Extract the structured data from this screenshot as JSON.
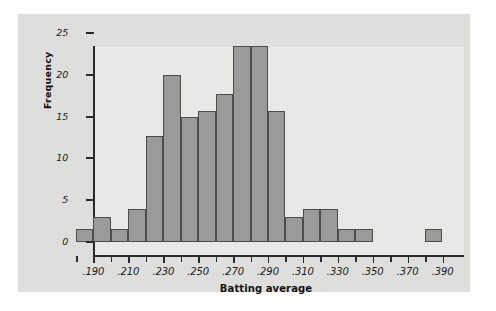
{
  "chart_data": {
    "type": "bar",
    "subtype": "histogram",
    "title": "",
    "xlabel": "Batting average",
    "ylabel": "Frequency",
    "bin_width": 0.01,
    "bin_starts": [
      0.18,
      0.19,
      0.2,
      0.21,
      0.22,
      0.23,
      0.24,
      0.25,
      0.26,
      0.27,
      0.28,
      0.29,
      0.3,
      0.31,
      0.32,
      0.33,
      0.34,
      0.35,
      0.36,
      0.37,
      0.38
    ],
    "categories": [
      ".180-.190",
      ".190-.200",
      ".200-.210",
      ".210-.220",
      ".220-.230",
      ".230-.240",
      ".240-.250",
      ".250-.260",
      ".260-.270",
      ".270-.280",
      ".280-.290",
      ".290-.300",
      ".300-.310",
      ".310-.320",
      ".320-.330",
      ".330-.340",
      ".340-.350",
      ".350-.360",
      ".360-.370",
      ".370-.380",
      ".380-.390"
    ],
    "values": [
      1.5,
      3,
      1.5,
      4,
      12.7,
      20,
      15,
      15.7,
      17.7,
      23.4,
      23.4,
      15.7,
      3,
      4,
      4,
      1.5,
      1.5,
      0,
      0,
      0,
      1.5
    ],
    "xlim": [
      0.18,
      0.392
    ],
    "ylim": [
      0,
      25
    ],
    "xticks": [
      0.19,
      0.21,
      0.23,
      0.25,
      0.27,
      0.29,
      0.31,
      0.33,
      0.35,
      0.37,
      0.39
    ],
    "xtick_labels": [
      ".190",
      ".210",
      ".230",
      ".250",
      ".270",
      ".290",
      ".310",
      ".330",
      ".350",
      ".370",
      ".390"
    ],
    "xtick_minor": [
      0.18,
      0.2,
      0.22,
      0.24,
      0.26,
      0.28,
      0.3,
      0.32,
      0.34,
      0.36,
      0.38
    ],
    "yticks": [
      0,
      5,
      10,
      15,
      20,
      25
    ],
    "ytick_labels": [
      "0",
      "5",
      "10",
      "15",
      "20",
      "25"
    ],
    "grid": false,
    "legend": "none",
    "colors": {
      "bar_fill": "#9a9a9a",
      "bar_edge": "#4d4d4d",
      "plot_background": "#e8e8e6",
      "panel_background": "#dededc",
      "axis": "#2b2b2b",
      "text": "#1a1a1a"
    }
  }
}
